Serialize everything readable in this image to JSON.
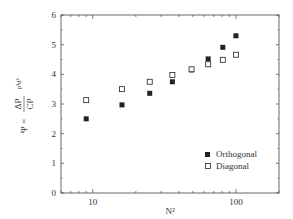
{
  "chart_data": {
    "type": "scatter",
    "title": "",
    "xlabel": "N²",
    "ylabel": "Ψ = ΔP/CP ρ³d³",
    "ylabel_parts": {
      "psi": "Ψ =",
      "num": "ΔP",
      "den": "CP",
      "suffix": "ρ³d³"
    },
    "xscale": "log",
    "xlim": [
      6,
      200
    ],
    "ylim": [
      0,
      6
    ],
    "xticks": [
      10,
      100
    ],
    "xtick_labels": [
      "10",
      "100"
    ],
    "yticks": [
      0,
      1,
      2,
      3,
      4,
      5,
      6
    ],
    "ytick_labels": [
      "0",
      "1",
      "2",
      "3",
      "4",
      "5",
      "6"
    ],
    "grid": false,
    "legend_position": "lower right",
    "series": [
      {
        "name": "Orthogonal",
        "marker": "filled-square",
        "color": "#222222",
        "x": [
          9,
          16,
          25,
          36,
          49,
          64,
          81,
          100
        ],
        "y": [
          2.5,
          2.97,
          3.36,
          3.75,
          4.15,
          4.52,
          4.91,
          5.3
        ]
      },
      {
        "name": "Diagonal",
        "marker": "open-square",
        "color": "#222222",
        "x": [
          9,
          16,
          25,
          36,
          49,
          64,
          81,
          100
        ],
        "y": [
          3.13,
          3.5,
          3.75,
          3.98,
          4.17,
          4.34,
          4.49,
          4.66
        ]
      }
    ]
  }
}
